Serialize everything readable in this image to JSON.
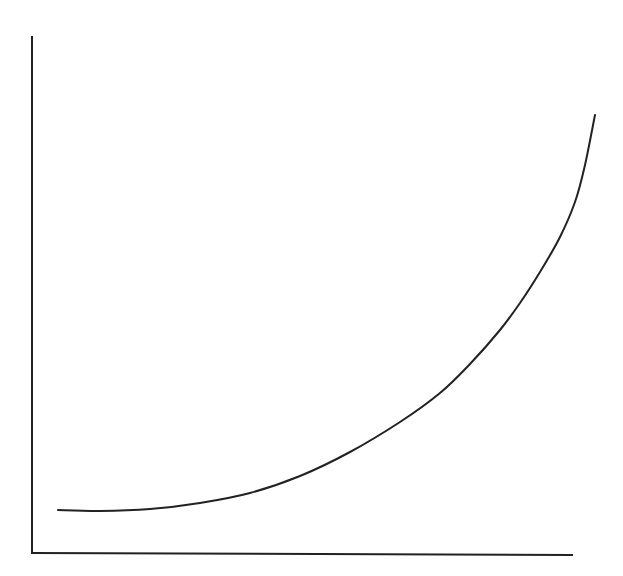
{
  "chart_data": {
    "type": "line",
    "title": "",
    "xlabel": "",
    "ylabel": "",
    "grid": false,
    "legend": null,
    "series": [
      {
        "name": "curve",
        "color": "#222222",
        "points_px": [
          [
            58,
            510
          ],
          [
            100,
            511
          ],
          [
            150,
            509
          ],
          [
            200,
            503
          ],
          [
            250,
            493
          ],
          [
            300,
            476
          ],
          [
            350,
            452
          ],
          [
            400,
            422
          ],
          [
            440,
            393
          ],
          [
            470,
            364
          ],
          [
            500,
            330
          ],
          [
            520,
            303
          ],
          [
            540,
            272
          ],
          [
            560,
            237
          ],
          [
            575,
            202
          ],
          [
            585,
            165
          ],
          [
            595,
            115
          ]
        ]
      }
    ],
    "axes": {
      "y_axis_px": [
        [
          32,
          37
        ],
        [
          32,
          553
        ]
      ],
      "x_axis_px": [
        [
          32,
          553
        ],
        [
          572,
          555
        ]
      ],
      "color": "#222222"
    }
  }
}
